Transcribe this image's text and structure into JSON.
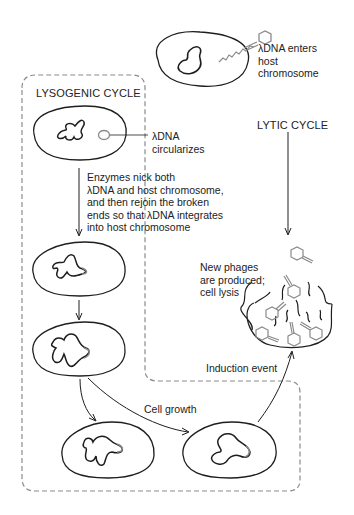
{
  "diagram": {
    "labels": {
      "entry": "λDNA enters\nhost\nchromosome",
      "lysogenic_title": "LYSOGENIC CYCLE",
      "lytic_title": "LYTIC CYCLE",
      "circularizes": "λDNA\ncircularizes",
      "integration": "Enzymes nick both\nλDNA and host chromosome,\nand then rejoin the broken\nends so that λDNA integrates\ninto host chromosome",
      "lysis": "New phages\nare produced;\ncell lysis",
      "induction": "Induction event",
      "growth": "Cell growth"
    },
    "colors": {
      "line": "#1e1e1e",
      "phage_dna": "#8a8a8a",
      "dashed_border": "#8c8c8c"
    }
  }
}
